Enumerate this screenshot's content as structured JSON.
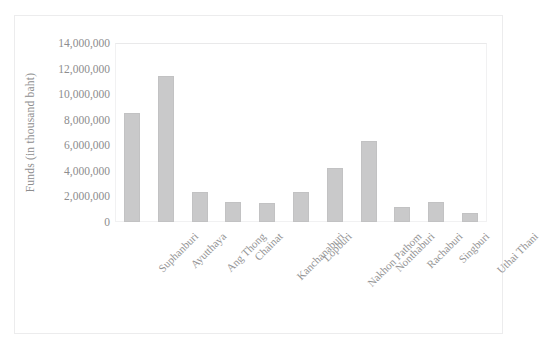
{
  "chart_data": {
    "type": "bar",
    "title": "",
    "subtitle": "",
    "xlabel": "",
    "ylabel": "Funds (in thousand baht)",
    "ylim": [
      0,
      14000000
    ],
    "ytick_labels": [
      "14,000,000",
      "12,000,000",
      "10,000,000",
      "8,000,000",
      "6,000,000",
      "4,000,000",
      "2,000,000",
      "0"
    ],
    "ytick_values": [
      14000000,
      12000000,
      10000000,
      8000000,
      6000000,
      4000000,
      2000000,
      0
    ],
    "grid": false,
    "legend": false,
    "legend_position": "none",
    "bar_color": "#c9c9ca",
    "categories": [
      "Suphanburi",
      "Ayutthaya",
      "Ang Thong",
      "Chainat",
      "Kanchanaburi",
      "Lopburi",
      "Nakhon Pathom",
      "Nonthaburi",
      "Rachaburi",
      "Singburi",
      "Uthai Thani"
    ],
    "values": [
      8520000,
      11420000,
      2350000,
      1560000,
      1490000,
      2350000,
      4230000,
      6330000,
      1170000,
      1600000,
      700000
    ]
  },
  "figure": {
    "frame_color": "#ececed",
    "background": "#ffffff",
    "plot_border_color": "#f1f1f2"
  }
}
